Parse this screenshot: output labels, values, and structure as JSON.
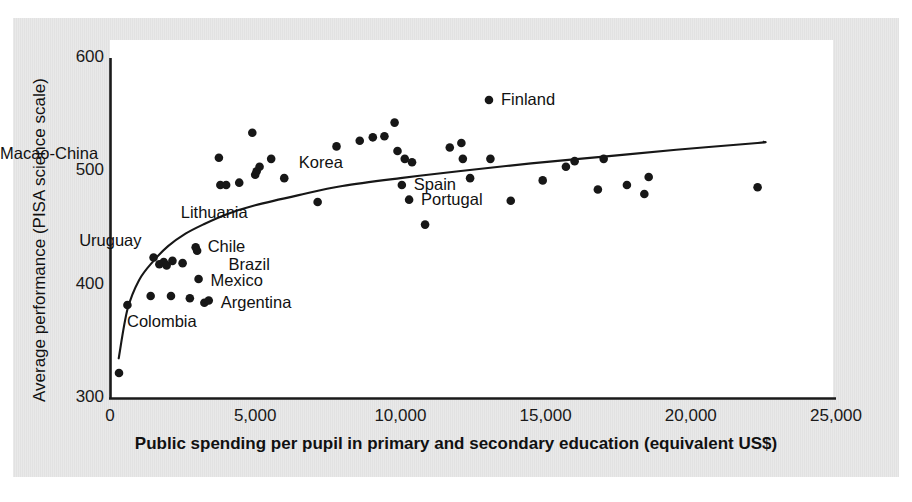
{
  "chart_data": {
    "type": "scatter",
    "title": "",
    "xlabel": "Public spending per pupil in primary and secondary education (equivalent US$)",
    "ylabel": "Average performance (PISA science scale)",
    "xlim": [
      0,
      25000
    ],
    "ylim": [
      300,
      600
    ],
    "xticks": [
      0,
      5000,
      10000,
      15000,
      20000,
      25000
    ],
    "xtick_labels": [
      "0",
      "5,000",
      "10,000",
      "15,000",
      "20,000",
      "25,000"
    ],
    "yticks": [
      300,
      400,
      500,
      600
    ],
    "ytick_labels": [
      "300",
      "400",
      "500",
      "600"
    ],
    "grid": false,
    "legend": "none",
    "series": [
      {
        "name": "Countries",
        "marker": "filled-circle",
        "color": "#171717",
        "points": [
          {
            "x": 310,
            "y": 322
          },
          {
            "x": 600,
            "y": 382
          },
          {
            "x": 1400,
            "y": 390
          },
          {
            "x": 1500,
            "y": 424
          },
          {
            "x": 1700,
            "y": 418
          },
          {
            "x": 1850,
            "y": 420
          },
          {
            "x": 1950,
            "y": 417
          },
          {
            "x": 2100,
            "y": 390
          },
          {
            "x": 2150,
            "y": 421
          },
          {
            "x": 2500,
            "y": 419
          },
          {
            "x": 2750,
            "y": 388
          },
          {
            "x": 2950,
            "y": 433
          },
          {
            "x": 3000,
            "y": 430
          },
          {
            "x": 3050,
            "y": 405
          },
          {
            "x": 3250,
            "y": 384
          },
          {
            "x": 3400,
            "y": 386
          },
          {
            "x": 3750,
            "y": 512
          },
          {
            "x": 3800,
            "y": 488
          },
          {
            "x": 4000,
            "y": 488
          },
          {
            "x": 4450,
            "y": 490
          },
          {
            "x": 4900,
            "y": 534
          },
          {
            "x": 5000,
            "y": 497
          },
          {
            "x": 5050,
            "y": 500
          },
          {
            "x": 5150,
            "y": 504
          },
          {
            "x": 5550,
            "y": 511
          },
          {
            "x": 6000,
            "y": 494
          },
          {
            "x": 7150,
            "y": 473
          },
          {
            "x": 7800,
            "y": 522
          },
          {
            "x": 8600,
            "y": 527
          },
          {
            "x": 9050,
            "y": 530
          },
          {
            "x": 9450,
            "y": 531
          },
          {
            "x": 9800,
            "y": 543
          },
          {
            "x": 9900,
            "y": 518
          },
          {
            "x": 10050,
            "y": 488
          },
          {
            "x": 10150,
            "y": 511
          },
          {
            "x": 10300,
            "y": 475
          },
          {
            "x": 10400,
            "y": 508
          },
          {
            "x": 10850,
            "y": 453
          },
          {
            "x": 11700,
            "y": 521
          },
          {
            "x": 12100,
            "y": 525
          },
          {
            "x": 12150,
            "y": 511
          },
          {
            "x": 12400,
            "y": 494
          },
          {
            "x": 13050,
            "y": 563
          },
          {
            "x": 13100,
            "y": 511
          },
          {
            "x": 13800,
            "y": 474
          },
          {
            "x": 14900,
            "y": 492
          },
          {
            "x": 15700,
            "y": 504
          },
          {
            "x": 16000,
            "y": 509
          },
          {
            "x": 16800,
            "y": 484
          },
          {
            "x": 17000,
            "y": 511
          },
          {
            "x": 17800,
            "y": 488
          },
          {
            "x": 18400,
            "y": 480
          },
          {
            "x": 18550,
            "y": 495
          },
          {
            "x": 22300,
            "y": 486
          }
        ]
      }
    ],
    "trend_curve": {
      "name": "logarithmic fit",
      "color": "#171717",
      "points": [
        {
          "x": 300,
          "y": 335
        },
        {
          "x": 600,
          "y": 378
        },
        {
          "x": 1000,
          "y": 404
        },
        {
          "x": 1500,
          "y": 421
        },
        {
          "x": 2000,
          "y": 434
        },
        {
          "x": 2600,
          "y": 445
        },
        {
          "x": 3200,
          "y": 453
        },
        {
          "x": 4000,
          "y": 462
        },
        {
          "x": 5000,
          "y": 470
        },
        {
          "x": 6500,
          "y": 479
        },
        {
          "x": 8000,
          "y": 487
        },
        {
          "x": 10000,
          "y": 494
        },
        {
          "x": 12000,
          "y": 500
        },
        {
          "x": 14500,
          "y": 507
        },
        {
          "x": 17000,
          "y": 513
        },
        {
          "x": 19500,
          "y": 519
        },
        {
          "x": 22300,
          "y": 525
        },
        {
          "x": 22500,
          "y": 526
        }
      ]
    },
    "annotations": [
      {
        "label": "Macao-China",
        "x": 3750,
        "y": 512,
        "dx": -175,
        "dy": -4,
        "align": "right"
      },
      {
        "label": "Lithuania",
        "x": 4450,
        "y": 490,
        "dx": -25,
        "dy": 30,
        "align": "center"
      },
      {
        "label": "Korea",
        "x": 9050,
        "y": 530,
        "dx": -52,
        "dy": 26,
        "align": "center"
      },
      {
        "label": "Finland",
        "x": 13050,
        "y": 563,
        "dx": 12,
        "dy": 0,
        "align": "left"
      },
      {
        "label": "Spain",
        "x": 10050,
        "y": 488,
        "dx": 12,
        "dy": 0,
        "align": "left"
      },
      {
        "label": "Portugal",
        "x": 10300,
        "y": 475,
        "dx": 12,
        "dy": 0,
        "align": "left"
      },
      {
        "label": "Uruguay",
        "x": 1500,
        "y": 424,
        "dx": -12,
        "dy": -16,
        "align": "right"
      },
      {
        "label": "Chile",
        "x": 2950,
        "y": 433,
        "dx": 12,
        "dy": 0,
        "align": "left"
      },
      {
        "label": "Brazil",
        "x": 2500,
        "y": 419,
        "dx": 46,
        "dy": 2,
        "align": "left"
      },
      {
        "label": "Mexico",
        "x": 3050,
        "y": 405,
        "dx": 12,
        "dy": 2,
        "align": "left"
      },
      {
        "label": "Argentina",
        "x": 3400,
        "y": 386,
        "dx": 12,
        "dy": 2,
        "align": "left"
      },
      {
        "label": "Colombia",
        "x": 2750,
        "y": 388,
        "dx": -28,
        "dy": 24,
        "align": "center"
      }
    ]
  }
}
